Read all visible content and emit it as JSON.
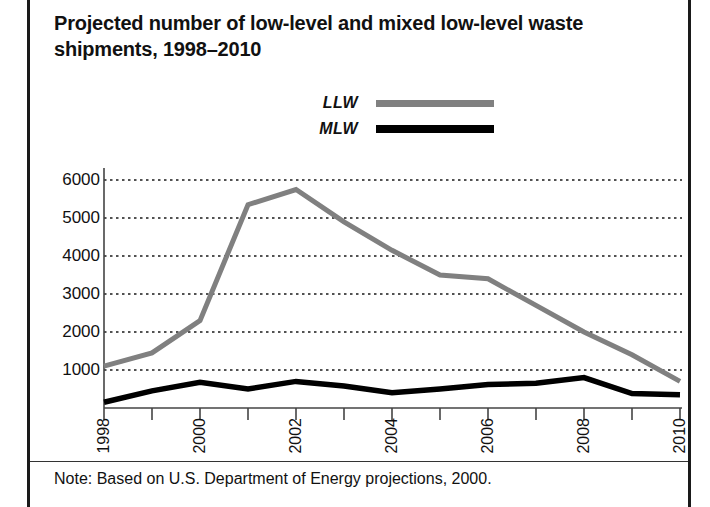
{
  "title": "Projected number of low-level and mixed low-level waste shipments, 1998–2010",
  "note": "Note: Based on U.S. Department of Energy projections, 2000.",
  "legend": [
    {
      "label": "LLW",
      "color": "#808080"
    },
    {
      "label": "MLW",
      "color": "#000000"
    }
  ],
  "chart_data": {
    "type": "line",
    "title": "Projected number of low-level and mixed low-level waste shipments, 1998–2010",
    "xlabel": "",
    "ylabel": "",
    "x": [
      1998,
      1999,
      2000,
      2001,
      2002,
      2003,
      2004,
      2005,
      2006,
      2007,
      2008,
      2009,
      2010
    ],
    "xtick_labels": [
      "1998",
      "",
      "2000",
      "",
      "2002",
      "",
      "2004",
      "",
      "2006",
      "",
      "2008",
      "",
      "2010"
    ],
    "xlim": [
      1998,
      2010
    ],
    "ytick_labels": [
      "1000",
      "2000",
      "3000",
      "4000",
      "5000",
      "6000"
    ],
    "yticks": [
      1000,
      2000,
      3000,
      4000,
      5000,
      6000
    ],
    "ylim": [
      0,
      6500
    ],
    "grid": "horizontal-dotted",
    "legend_position": "above-plot-center",
    "series": [
      {
        "name": "LLW",
        "color": "#808080",
        "values": [
          1100,
          1450,
          2300,
          5350,
          5750,
          4900,
          4150,
          3500,
          3400,
          2700,
          2000,
          1400,
          700
        ]
      },
      {
        "name": "MLW",
        "color": "#000000",
        "values": [
          150,
          450,
          680,
          500,
          700,
          580,
          400,
          500,
          620,
          650,
          800,
          380,
          350
        ]
      }
    ],
    "annotations": [
      "Note: Based on U.S. Department of Energy projections, 2000."
    ]
  }
}
